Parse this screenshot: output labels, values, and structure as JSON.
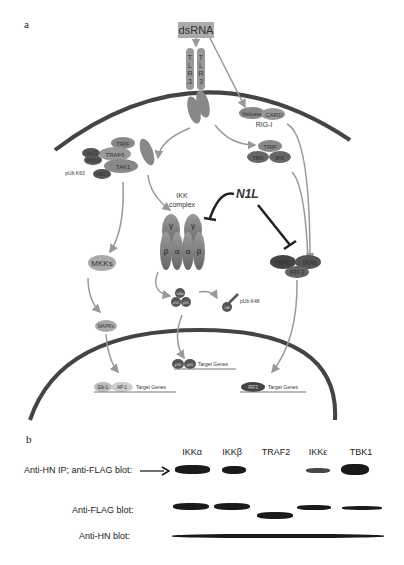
{
  "panel_a": {
    "label": "a",
    "stimulus": "dsRNA",
    "tlr3": [
      "T",
      "L",
      "R",
      "3"
    ],
    "adaptors": {
      "trif": "TRIF",
      "rip": "RIP",
      "traf6": "TRAF6",
      "tak1": "TAK1",
      "tab2": "TAB2/3",
      "ubc13": "Ubc13",
      "uev1a": "Uev1A",
      "pub_k63": "pUb K63",
      "rip1": "RIP1"
    },
    "rig_i": {
      "helicase": "Helicase",
      "card": "CARD",
      "label": "RIG-I"
    },
    "trif_complex": {
      "trif": "TRIF",
      "tbk": "TBK",
      "ikk": "IKK"
    },
    "ikk_complex": {
      "label_1": "IKK",
      "label_2": "complex",
      "subunits": [
        "β",
        "α",
        "α",
        "β"
      ],
      "gamma": [
        "γ",
        "γ"
      ]
    },
    "inhibitor": "N1L",
    "tbk1_complex": {
      "tbk1": "TBK1",
      "ikke": "IKKε",
      "irf3": "IRF3"
    },
    "mkks": "MKKs",
    "mapks": "MAPKs",
    "nfkb": {
      "ikb": "IκBα",
      "p50": "p50",
      "p65": "p65"
    },
    "degraded": {
      "ikb": "IκB",
      "pub_k48": "pUb K48"
    },
    "nucleus": {
      "ap1_row": {
        "elk": "Elk-1",
        "ap1": "AP-1",
        "genes": "Target Genes"
      },
      "nfkb_row": {
        "p50": "p50",
        "p65": "p65",
        "genes": "Target Genes"
      },
      "irf_row": {
        "irf": "IRF3",
        "genes": "Target Genes"
      }
    }
  },
  "panel_b": {
    "label": "b",
    "lanes": [
      "IKKα",
      "IKKβ",
      "TRAF2",
      "IKKε",
      "TBK1"
    ],
    "rows": [
      {
        "label": "Anti-HN IP; anti-FLAG blot:",
        "arrow": true
      },
      {
        "label": "Anti-FLAG blot:"
      },
      {
        "label": "Anti-HN blot:"
      }
    ]
  }
}
